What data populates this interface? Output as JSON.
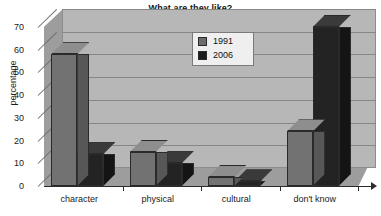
{
  "chart_data": {
    "type": "bar",
    "title": "What are they like?",
    "xlabel": "",
    "ylabel": "percentage",
    "categories": [
      "character",
      "physical",
      "cultural",
      "don't know"
    ],
    "series": [
      {
        "name": "1991",
        "color": "#727272",
        "values": [
          58,
          15,
          4,
          24
        ]
      },
      {
        "name": "2006",
        "color": "#232323",
        "values": [
          14,
          10,
          2,
          70
        ]
      }
    ],
    "ylim": [
      0,
      70
    ],
    "yticks": [
      0,
      10,
      20,
      30,
      40,
      50,
      60,
      70
    ],
    "ytick_labels": [
      "0",
      "10",
      "20",
      "30",
      "40",
      "50",
      "60",
      "70"
    ],
    "grid": true,
    "legend_position": "top-center",
    "style": "3d-column"
  }
}
